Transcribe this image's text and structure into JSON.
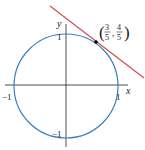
{
  "diagram": {
    "axes": {
      "x_label": "x",
      "y_label": "y",
      "tick_x_neg": "−1",
      "tick_x_pos": "1",
      "tick_y_pos": "1",
      "tick_y_neg": "−1"
    },
    "point": {
      "num_x": "3",
      "den_x": "5",
      "num_y": "4",
      "den_y": "5",
      "open": "(",
      "comma": ",",
      "close": ")"
    },
    "colors": {
      "circle": "#3a7fc1",
      "tangent": "#d94b4b",
      "axes": "#222222",
      "point": "#000000"
    }
  }
}
